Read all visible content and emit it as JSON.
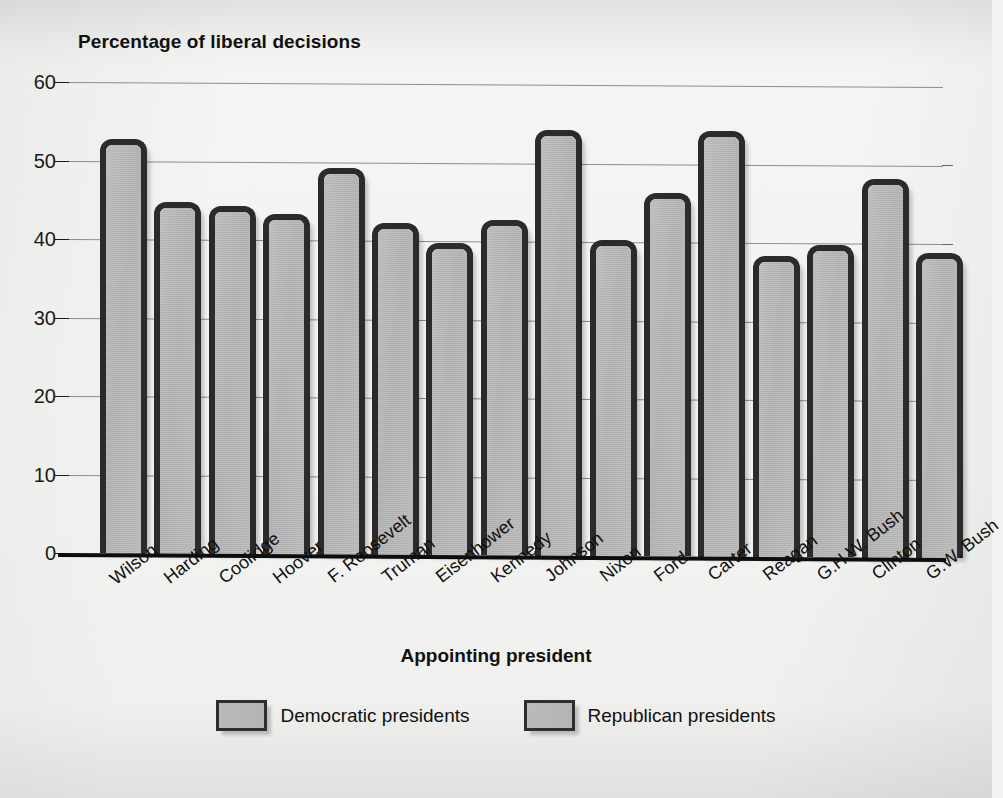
{
  "chart_data": {
    "type": "bar",
    "title": "",
    "ylabel": "Percentage of liberal decisions",
    "xlabel": "Appointing president",
    "ylim": [
      0,
      60
    ],
    "yticks": [
      0,
      10,
      20,
      30,
      40,
      50,
      60
    ],
    "grid": true,
    "legend_position": "bottom",
    "categories": [
      "Wilson",
      "Harding",
      "Coolidge",
      "Hoover",
      "F. Roosevelt",
      "Truman",
      "Eisenhower",
      "Kennedy",
      "Johnson",
      "Nixon",
      "Ford",
      "Carter",
      "Reagan",
      "G.H.W. Bush",
      "Clinton",
      "G.W. Bush"
    ],
    "values": [
      51,
      43,
      42.5,
      41.5,
      47.5,
      40.5,
      38,
      41,
      52.5,
      38.5,
      44.5,
      52.5,
      36.5,
      38,
      46.5,
      37
    ],
    "parties": [
      "Democratic",
      "Republican",
      "Republican",
      "Republican",
      "Democratic",
      "Democratic",
      "Republican",
      "Democratic",
      "Democratic",
      "Republican",
      "Republican",
      "Democratic",
      "Republican",
      "Republican",
      "Democratic",
      "Republican"
    ],
    "legend": [
      {
        "label": "Democratic presidents",
        "color": "#bababa"
      },
      {
        "label": "Republican presidents",
        "color": "#bababa"
      }
    ]
  },
  "colors": {
    "bar_fill": "#bababa",
    "bar_outline": "#2b2b2b",
    "axis": "#0d0d0d",
    "gridline": "#8d8d8d",
    "text": "#111111",
    "page_background": "#f3f3f1"
  },
  "caption": ""
}
